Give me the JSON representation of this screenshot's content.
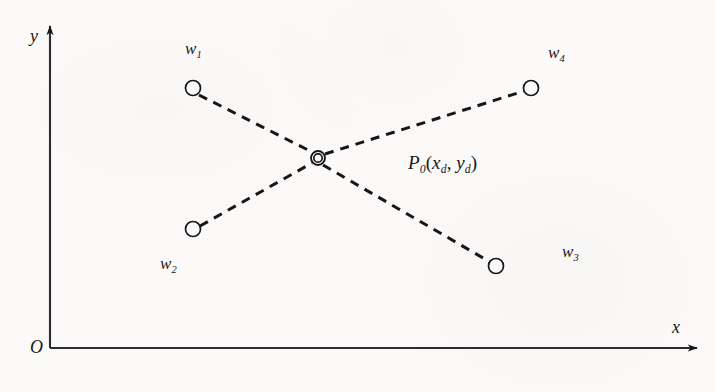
{
  "figure": {
    "type": "cartesian-scatter-diagram",
    "background_color": "#fbfaf8",
    "stroke_color": "#17171a",
    "width": 715,
    "height": 392
  },
  "axes": {
    "origin_label": "O",
    "x_axis": {
      "label": "x",
      "label_x": 672,
      "label_y": 318,
      "start_x": 50,
      "start_y": 348,
      "end_x": 697,
      "end_y": 348
    },
    "y_axis": {
      "label": "y",
      "label_x": 30,
      "label_y": 27,
      "start_x": 50,
      "start_y": 348,
      "end_x": 50,
      "end_y": 26
    },
    "origin_label_x": 30,
    "origin_label_y": 338
  },
  "center_point": {
    "name": "P0",
    "label_base": "P",
    "label_sub": "0",
    "label_full": "P₀(xᵈ, yᵈ)",
    "coord_open": "(",
    "coord_x_base": "x",
    "coord_x_sub": "d",
    "coord_sep": ",",
    "coord_y_base": "y",
    "coord_y_sub": "d",
    "coord_close": ")",
    "cx": 318,
    "cy": 158,
    "outer_radius": 7,
    "inner_radius": 4.2,
    "label_x": 408,
    "label_y": 153
  },
  "nodes": [
    {
      "id": "w1",
      "label_base": "w",
      "label_sub": "1",
      "label_text": "w₁",
      "cx": 193,
      "cy": 88,
      "radius": 7.5,
      "label_x": 185,
      "label_y": 40
    },
    {
      "id": "w2",
      "label_base": "w",
      "label_sub": "2",
      "label_text": "w₂",
      "cx": 193,
      "cy": 229,
      "radius": 7.5,
      "label_x": 160,
      "label_y": 255
    },
    {
      "id": "w3",
      "label_base": "w",
      "label_sub": "3",
      "label_text": "w₃",
      "cx": 496,
      "cy": 266,
      "radius": 7.5,
      "label_x": 562,
      "label_y": 243
    },
    {
      "id": "w4",
      "label_base": "w",
      "label_sub": "4",
      "label_text": "w₄",
      "cx": 531,
      "cy": 88,
      "radius": 7.5,
      "label_x": 548,
      "label_y": 44
    }
  ],
  "connections": [
    {
      "id": "w1-to-p0",
      "from": "w1",
      "to": "P0",
      "x1": 199,
      "y1": 95,
      "x2": 312,
      "y2": 152,
      "style": "dashed"
    },
    {
      "id": "w2-to-p0",
      "from": "w2",
      "to": "P0",
      "x1": 200,
      "y1": 226,
      "x2": 312,
      "y2": 163,
      "style": "dashed"
    },
    {
      "id": "p0-to-w3",
      "from": "P0",
      "to": "w3",
      "x1": 323,
      "y1": 165,
      "x2": 490,
      "y2": 262,
      "style": "dashed"
    },
    {
      "id": "p0-to-w4",
      "from": "P0",
      "to": "w4",
      "x1": 325,
      "y1": 154,
      "x2": 524,
      "y2": 91,
      "style": "dashed"
    }
  ]
}
